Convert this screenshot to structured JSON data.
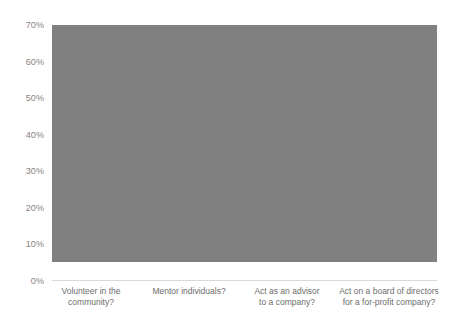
{
  "chart_data": {
    "type": "bar",
    "title": "",
    "subtitle": "",
    "xlabel": "",
    "ylabel": "",
    "categories": [
      "Volunteer in the\ncommunity?",
      "Mentor individuals?",
      "Act as an advisor\nto a company?",
      "Act on a board of directors\nfor a for-profit company?"
    ],
    "values": [
      65,
      65,
      57,
      35
    ],
    "value_labels": [
      "65%",
      "65%",
      "57%",
      "35%"
    ],
    "ylim": [
      0,
      70
    ],
    "ytick_values": [
      0,
      10,
      20,
      30,
      40,
      50,
      60,
      70
    ],
    "ytick_labels": [
      "0%",
      "10%",
      "20%",
      "30%",
      "40%",
      "50%",
      "60%",
      "70%"
    ],
    "grid": true,
    "grid_axis": "y",
    "legend": false,
    "legend_position": "none",
    "bar_color": "#808080",
    "grid_color": "#e8e8e8",
    "axis_label_color": "#848484",
    "category_label_color": "#6e6e6e",
    "background_color": "#ffffff"
  }
}
